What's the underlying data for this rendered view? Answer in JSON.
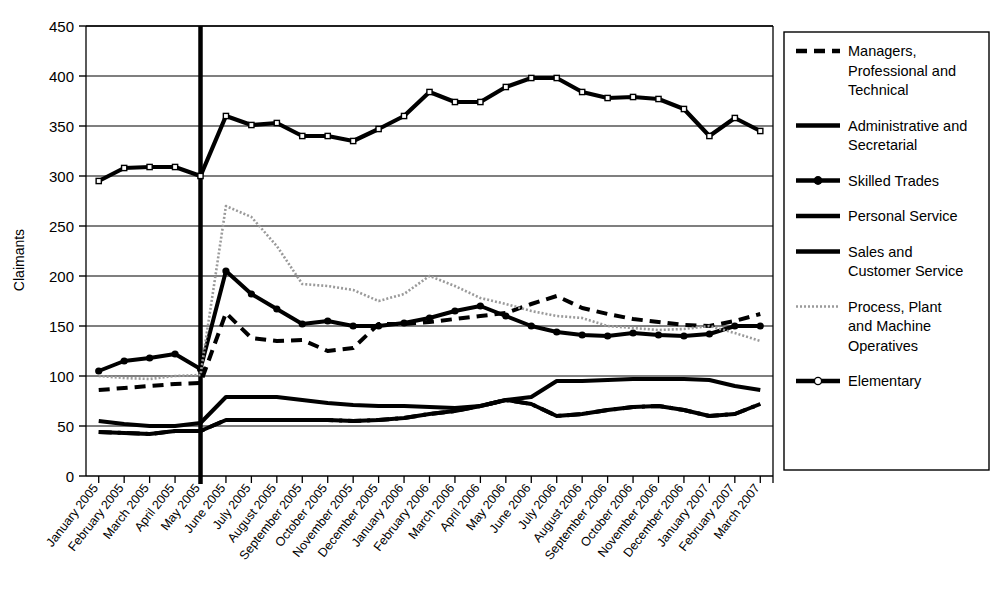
{
  "chart_data": {
    "type": "line",
    "title": "",
    "xlabel": "",
    "ylabel": "Claimants",
    "ylim": [
      0,
      450
    ],
    "yticks": [
      0,
      50,
      100,
      150,
      200,
      250,
      300,
      350,
      400,
      450
    ],
    "grid": true,
    "legend_position": "right",
    "annotation": {
      "vertical_marker_label": "May 2005",
      "vertical_marker_index": 4
    },
    "categories": [
      "January 2005",
      "February 2005",
      "March 2005",
      "April 2005",
      "May 2005",
      "June 2005",
      "July 2005",
      "August 2005",
      "September 2005",
      "October 2005",
      "November 2005",
      "December 2005",
      "January 2006",
      "February 2006",
      "March 2006",
      "April 2006",
      "May 2006",
      "June 2006",
      "July 2006",
      "August 2006",
      "September 2006",
      "October 2006",
      "November 2006",
      "December 2006",
      "January 2007",
      "February 2007",
      "March 2007"
    ],
    "series": [
      {
        "name": "Managers, Professional and Technical",
        "style": "dashed",
        "marker": "none",
        "color": "#000000",
        "values": [
          86,
          88,
          90,
          92,
          93,
          163,
          138,
          135,
          136,
          125,
          128,
          152,
          152,
          154,
          157,
          160,
          163,
          172,
          180,
          168,
          162,
          157,
          154,
          151,
          150,
          155,
          162
        ]
      },
      {
        "name": "Administrative and Secretarial",
        "style": "solid",
        "marker": "none",
        "color": "#000000",
        "values": [
          55,
          52,
          50,
          50,
          53,
          79,
          79,
          79,
          76,
          73,
          71,
          70,
          70,
          69,
          68,
          70,
          76,
          79,
          95,
          95,
          96,
          97,
          97,
          97,
          96,
          90,
          86
        ]
      },
      {
        "name": "Skilled Trades",
        "style": "solid",
        "marker": "circle",
        "color": "#000000",
        "values": [
          105,
          115,
          118,
          122,
          107,
          205,
          182,
          167,
          152,
          155,
          150,
          150,
          153,
          158,
          165,
          170,
          160,
          150,
          144,
          141,
          140,
          143,
          141,
          140,
          142,
          150,
          150
        ]
      },
      {
        "name": "Personal Service",
        "style": "solid",
        "marker": "none",
        "color": "#000000",
        "values": [
          44,
          43,
          42,
          45,
          45,
          56,
          56,
          56,
          56,
          56,
          55,
          56,
          58,
          62,
          65,
          70,
          76,
          72,
          60,
          62,
          66,
          69,
          70,
          66,
          60,
          62,
          72
        ]
      },
      {
        "name": "Sales and Customer Service",
        "style": "dash-dot",
        "marker": "none",
        "color": "#000000",
        "values": [
          44,
          43,
          42,
          45,
          45,
          56,
          56,
          56,
          56,
          56,
          55,
          56,
          58,
          62,
          65,
          70,
          76,
          72,
          60,
          62,
          66,
          69,
          70,
          66,
          60,
          62,
          72
        ]
      },
      {
        "name": "Process, Plant and Machine Operatives",
        "style": "dotted",
        "marker": "none",
        "color": "#9a9a9a",
        "values": [
          100,
          98,
          97,
          100,
          101,
          270,
          259,
          230,
          192,
          190,
          186,
          175,
          182,
          200,
          190,
          178,
          172,
          165,
          160,
          158,
          150,
          148,
          146,
          147,
          150,
          143,
          135
        ]
      },
      {
        "name": "Elementary",
        "style": "solid",
        "marker": "square",
        "color": "#000000",
        "values": [
          295,
          308,
          309,
          309,
          300,
          360,
          351,
          353,
          340,
          340,
          335,
          347,
          360,
          384,
          374,
          374,
          389,
          398,
          398,
          384,
          378,
          379,
          377,
          367,
          340,
          358,
          345
        ]
      }
    ]
  },
  "legend": {
    "items": [
      {
        "label": "Managers, Professional and Technical",
        "style": "dashed",
        "marker": "none"
      },
      {
        "label": "Administrative and Secretarial",
        "style": "solid",
        "marker": "none"
      },
      {
        "label": "Skilled Trades",
        "style": "solid",
        "marker": "circle"
      },
      {
        "label": "Personal Service",
        "style": "solid",
        "marker": "none"
      },
      {
        "label": "Sales and Customer Service",
        "style": "solid",
        "marker": "none"
      },
      {
        "label": "Process, Plant and Machine Operatives",
        "style": "dotted",
        "marker": "none"
      },
      {
        "label": "Elementary",
        "style": "solid",
        "marker": "circle-open"
      }
    ]
  }
}
